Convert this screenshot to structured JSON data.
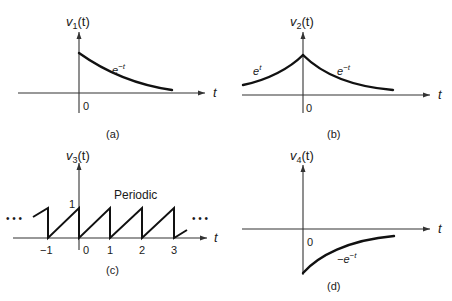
{
  "panels": [
    {
      "id": "a",
      "caption": "(a)",
      "y_label": "v",
      "y_label_sub": "1",
      "y_label_arg": "(t)",
      "x_label": "t",
      "origin_label": "0",
      "curve_label_base": "e",
      "curve_label_exp": "−t"
    },
    {
      "id": "b",
      "caption": "(b)",
      "y_label": "v",
      "y_label_sub": "2",
      "y_label_arg": "(t)",
      "x_label": "t",
      "origin_label": "0",
      "left_curve_label_base": "e",
      "left_curve_label_exp": "t",
      "right_curve_label_base": "e",
      "right_curve_label_exp": "−t"
    },
    {
      "id": "c",
      "caption": "(c)",
      "y_label": "v",
      "y_label_sub": "3",
      "y_label_arg": "(t)",
      "x_label": "t",
      "amplitude_label": "1",
      "annotation": "Periodic",
      "ellipsis_left": "• • •",
      "ellipsis_right": "• • •",
      "ticks": [
        "−1",
        "0",
        "1",
        "2",
        "3"
      ]
    },
    {
      "id": "d",
      "caption": "(d)",
      "y_label": "v",
      "y_label_sub": "4",
      "y_label_arg": "(t)",
      "x_label": "t",
      "origin_label": "0",
      "curve_label_base": "−e",
      "curve_label_exp": "−t"
    }
  ]
}
